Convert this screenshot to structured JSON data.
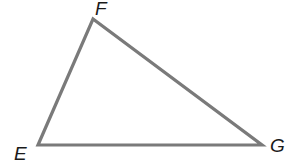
{
  "diagram": {
    "type": "triangle",
    "stroke_color": "#7a7a7a",
    "vertices": [
      {
        "label": "E",
        "x": 38,
        "y": 145
      },
      {
        "label": "F",
        "x": 93,
        "y": 19
      },
      {
        "label": "G",
        "x": 262,
        "y": 145
      }
    ],
    "labels": {
      "E": "E",
      "F": "F",
      "G": "G"
    }
  }
}
